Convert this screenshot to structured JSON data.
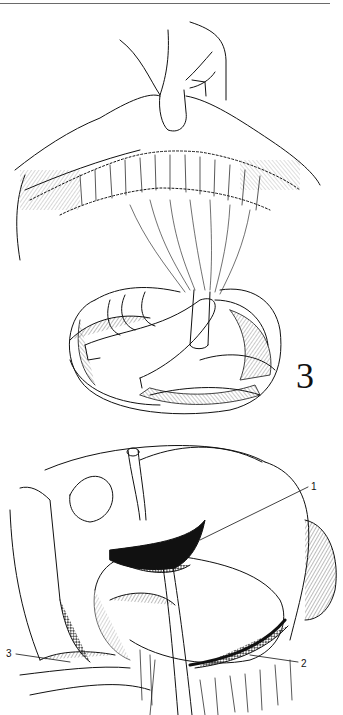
{
  "page": {
    "header_mark": "’’",
    "header_rule": true
  },
  "figures": [
    {
      "id": "figure-top",
      "number": "3",
      "description": "Hand holding up the transverse mesocolon/omentum while a second hand cradles the small bowel loops; a tube exits beneath the mesocolon"
    },
    {
      "id": "figure-bottom",
      "number": "",
      "description": "Operative view of the upper abdomen with stomach, liver edge and bowel; drain tube passing downward, with numbered callouts",
      "callouts": [
        {
          "label": "1"
        },
        {
          "label": "2"
        },
        {
          "label": "3"
        }
      ]
    }
  ],
  "colors": {
    "ink": "#111111",
    "paper": "#ffffff",
    "rule": "#6a6a6a"
  }
}
